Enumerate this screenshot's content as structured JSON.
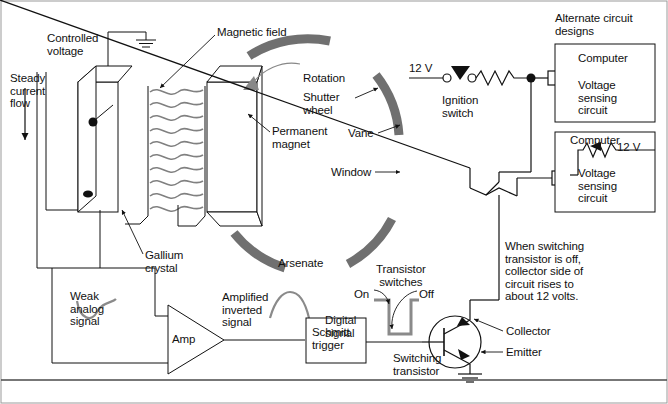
{
  "diagram": {
    "colors": {
      "line": "#111111",
      "vane_gray": "#707070",
      "field_gray": "#808080",
      "signal_gray": "#888888",
      "background": "#ffffff"
    }
  },
  "labels": {
    "controlled_voltage": "Controlled\nvoltage",
    "steady_current_flow": "Steady\ncurrent\nflow",
    "magnetic_field": "Magnetic field",
    "rotation": "Rotation",
    "shutter_wheel": "Shutter\nwheel",
    "vane": "Vane",
    "window": "Window",
    "permanent_magnet": "Permanent\nmagnet",
    "gallium": "Gallium\ncrystal",
    "arsenate": "Arsenate",
    "weak_analog_signal": "Weak\nanalog\nsignal",
    "amp": "Amp",
    "amplified_inverted_signal": "Amplified\ninverted\nsignal",
    "schmitt_trigger": "Schmitt\ntrigger",
    "digital_signal": "Digital\nsignal",
    "transistor_switches": "Transistor\nswitches",
    "on": "On",
    "off": "Off",
    "switching_transistor": "Switching\ntransistor",
    "collector": "Collector",
    "emitter": "Emitter",
    "twelve_volts": "12 V",
    "ignition_switch": "Ignition\nswitch",
    "alternate_circuit_designs": "Alternate circuit\ndesigns",
    "note": "When switching\ntransistor is off,\ncollector side of\ncircuit rises to\nabout 12 volts."
  },
  "alternate_circuits": [
    {
      "id": "alt-circuit-1",
      "computer": "Computer",
      "function": "Voltage\nsensing\ncircuit",
      "voltage": ""
    },
    {
      "id": "alt-circuit-2",
      "computer": "Computer",
      "function": "Voltage\nsensing\ncircuit",
      "voltage": "12 V"
    }
  ],
  "shutter_wheel": {
    "vane_count": 4,
    "window_count": 4
  }
}
